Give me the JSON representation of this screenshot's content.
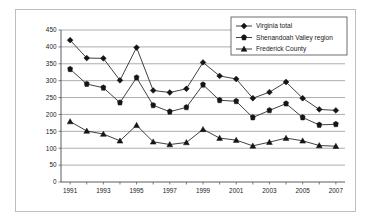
{
  "chart_data": {
    "type": "line",
    "title": "",
    "xlabel": "",
    "ylabel": "",
    "ylim": [
      0,
      450
    ],
    "ytick_step": 50,
    "yticks": [
      "0",
      "50",
      "100",
      "150",
      "200",
      "250",
      "300",
      "350",
      "400",
      "450"
    ],
    "grid": true,
    "legend_position": "top-right",
    "x": [
      1991,
      1992,
      1993,
      1994,
      1995,
      1996,
      1997,
      1998,
      1999,
      2000,
      2001,
      2002,
      2003,
      2004,
      2005,
      2006,
      2007
    ],
    "categories": [
      "1991",
      "1992",
      "1993",
      "1994",
      "1995",
      "1996",
      "1997",
      "1998",
      "1999",
      "2000",
      "2001",
      "2002",
      "2003",
      "2004",
      "2005",
      "2006",
      "2007"
    ],
    "xtick_labels_shown": [
      "1991",
      "1993",
      "1995",
      "1997",
      "1999",
      "2001",
      "2003",
      "2005",
      "2007"
    ],
    "series": [
      {
        "name": "Virginia total",
        "marker": "diamond",
        "values": [
          420,
          367,
          366,
          301,
          398,
          271,
          265,
          276,
          354,
          314,
          305,
          248,
          266,
          296,
          248,
          215,
          212
        ]
      },
      {
        "name": "Shenandoah Valley region",
        "marker": "square",
        "values": [
          334,
          290,
          279,
          235,
          309,
          227,
          208,
          221,
          288,
          242,
          239,
          191,
          212,
          232,
          191,
          169,
          171
        ]
      },
      {
        "name": "Frederick County",
        "marker": "triangle",
        "values": [
          179,
          151,
          142,
          122,
          168,
          119,
          111,
          117,
          156,
          130,
          124,
          107,
          118,
          130,
          122,
          108,
          106
        ]
      }
    ]
  },
  "legend": {
    "entries": [
      {
        "label": "Virginia total"
      },
      {
        "label": "Shenandoah Valley region"
      },
      {
        "label": "Frederick County"
      }
    ]
  },
  "colors": {
    "marker": "#151515",
    "line": "#2b2b2b",
    "gridline": "#8a8a8a",
    "axis": "#4a4a4a",
    "frame": "#bdbdbd",
    "background": "#ffffff"
  }
}
